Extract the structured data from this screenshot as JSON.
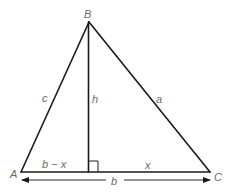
{
  "diagram": {
    "vertices": {
      "A": "A",
      "B": "B",
      "C": "C"
    },
    "sides": {
      "c": "c",
      "a": "a",
      "h": "h"
    },
    "base_segments": {
      "left": "b − x",
      "right": "x"
    },
    "base_total": "b",
    "right_angle_marker": true,
    "colors": {
      "line": "#1a1a1a",
      "label": "#6b6b6b",
      "background": "#ffffff"
    }
  }
}
